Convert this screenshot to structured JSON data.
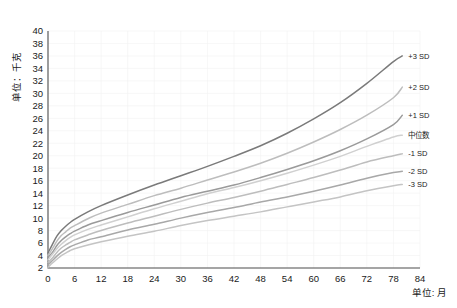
{
  "chart_data": {
    "type": "line",
    "title": "",
    "subtitle": "",
    "xlabel": "单位: 月",
    "ylabel": "单位：千克",
    "xlim": [
      0,
      84
    ],
    "ylim": [
      2,
      40
    ],
    "xticks": [
      0,
      6,
      12,
      18,
      24,
      30,
      36,
      42,
      48,
      54,
      60,
      66,
      72,
      78,
      84
    ],
    "yticks": [
      2,
      4,
      6,
      8,
      10,
      12,
      14,
      16,
      18,
      20,
      22,
      24,
      26,
      28,
      30,
      32,
      34,
      36,
      38,
      40
    ],
    "grid": true,
    "legend_position": "right-inline-labels",
    "x": [
      0,
      1,
      2,
      3,
      4,
      5,
      6,
      9,
      12,
      18,
      24,
      30,
      36,
      42,
      48,
      54,
      60,
      66,
      72,
      78,
      80
    ],
    "series": [
      {
        "name": "+3 SD",
        "label": "+3 SD",
        "color": "#7a7a7a",
        "width": 1.5,
        "values": [
          4.4,
          5.8,
          7.1,
          8.0,
          8.7,
          9.3,
          9.8,
          11.0,
          12.0,
          13.7,
          15.3,
          16.8,
          18.3,
          19.9,
          21.6,
          23.6,
          25.9,
          28.5,
          31.6,
          35.1,
          36.0
        ]
      },
      {
        "name": "+2 SD",
        "label": "+2 SD",
        "color": "#bdbdbd",
        "width": 1.5,
        "values": [
          4.0,
          5.1,
          6.3,
          7.2,
          7.8,
          8.4,
          8.8,
          9.9,
          10.8,
          12.2,
          13.6,
          14.8,
          16.1,
          17.4,
          18.8,
          20.4,
          22.2,
          24.2,
          26.5,
          29.3,
          31.0
        ]
      },
      {
        "name": "+1 SD",
        "label": "+1 SD",
        "color": "#9a9a9a",
        "width": 1.5,
        "values": [
          3.7,
          4.5,
          5.6,
          6.4,
          7.0,
          7.5,
          7.9,
          8.9,
          9.6,
          10.9,
          12.1,
          13.3,
          14.3,
          15.3,
          16.5,
          17.8,
          19.2,
          20.8,
          22.7,
          25.0,
          26.5
        ]
      },
      {
        "name": "中位数",
        "label": "中位数",
        "color": "#d0d0d0",
        "width": 1.5,
        "values": [
          3.3,
          4.2,
          5.1,
          5.8,
          6.4,
          6.9,
          7.3,
          8.2,
          8.9,
          10.2,
          11.5,
          12.7,
          13.9,
          14.9,
          16.0,
          17.2,
          18.5,
          19.9,
          21.5,
          23.0,
          23.3
        ]
      },
      {
        "name": "-1 SD",
        "label": "-1 SD",
        "color": "#bdbdbd",
        "width": 1.5,
        "values": [
          2.9,
          3.6,
          4.5,
          5.2,
          5.7,
          6.1,
          6.5,
          7.3,
          8.0,
          9.2,
          10.3,
          11.4,
          12.4,
          13.3,
          14.3,
          15.4,
          16.5,
          17.7,
          19.0,
          20.0,
          20.3
        ]
      },
      {
        "name": "-2 SD",
        "label": "-2 SD",
        "color": "#a8a8a8",
        "width": 1.5,
        "values": [
          2.5,
          3.2,
          3.9,
          4.5,
          5.0,
          5.4,
          5.7,
          6.5,
          7.0,
          8.1,
          9.0,
          10.0,
          10.9,
          11.7,
          12.6,
          13.4,
          14.3,
          15.3,
          16.4,
          17.3,
          17.5
        ]
      },
      {
        "name": "-3 SD",
        "label": "-3 SD",
        "color": "#c4c4c4",
        "width": 1.5,
        "values": [
          2.1,
          2.8,
          3.4,
          4.0,
          4.4,
          4.8,
          5.1,
          5.7,
          6.2,
          7.1,
          7.9,
          8.8,
          9.6,
          10.3,
          11.0,
          11.8,
          12.6,
          13.4,
          14.4,
          15.2,
          15.4
        ]
      }
    ]
  },
  "axis": {
    "y_unit_label": "单位：千克",
    "x_unit_label": "单位: 月"
  },
  "colors": {
    "axis": "#4d4d4d",
    "grid": "#f2f2f2",
    "text": "#1a1a1a",
    "background": "#ffffff"
  }
}
